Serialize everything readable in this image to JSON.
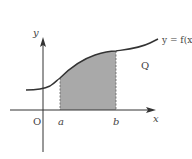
{
  "diagram": {
    "curve_label": "y = f(x)",
    "region_label": "Q",
    "origin_label": "O",
    "x_axis_label": "x",
    "y_axis_label": "y",
    "lower_bound_label": "a",
    "upper_bound_label": "b",
    "colors": {
      "shade": "#a9a9a9",
      "line": "#333333",
      "text": "#444444"
    }
  }
}
